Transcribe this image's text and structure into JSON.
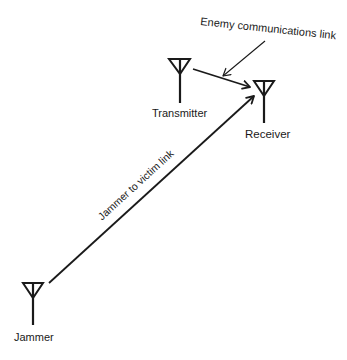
{
  "diagram": {
    "nodes": [
      {
        "id": "transmitter",
        "label": "Transmitter",
        "icon": "antenna-icon"
      },
      {
        "id": "receiver",
        "label": "Receiver",
        "icon": "antenna-icon"
      },
      {
        "id": "jammer",
        "label": "Jammer",
        "icon": "antenna-icon"
      }
    ],
    "links": [
      {
        "from": "transmitter",
        "to": "receiver",
        "type": "arrow"
      },
      {
        "from": "jammer",
        "to": "receiver",
        "type": "arrow",
        "label": "Jammer to victim link"
      }
    ],
    "annotations": [
      {
        "text": "Enemy communications link",
        "points_to": "transmitter-receiver-link"
      }
    ],
    "colors": {
      "stroke": "#1a1a1a",
      "background": "#ffffff"
    }
  }
}
